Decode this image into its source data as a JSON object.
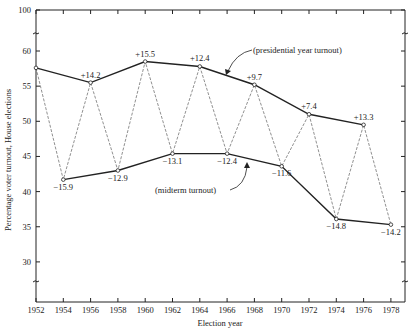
{
  "chart_data": {
    "type": "line",
    "title": "",
    "xlabel": "Election year",
    "ylabel": "Percentage voter turnout, House elections",
    "ylim": [
      25,
      100
    ],
    "y_axis_break": true,
    "y_ticks": [
      100,
      60,
      55,
      50,
      45,
      40,
      35,
      30
    ],
    "x_ticks": [
      "1952",
      "1954",
      "1956",
      "1958",
      "1960",
      "1962",
      "1964",
      "1966",
      "1968",
      "1970",
      "1972",
      "1974",
      "1976",
      "1978"
    ],
    "grid": false,
    "legend": "none",
    "series": [
      {
        "name": "presidential year turnout",
        "style": "solid",
        "x": [
          1952,
          1956,
          1960,
          1964,
          1968,
          1972,
          1976
        ],
        "values": [
          57.6,
          55.5,
          58.5,
          57.8,
          55.2,
          51.0,
          49.5
        ],
        "labels": [
          "",
          "+14.2",
          "+15.5",
          "+12.4",
          "+9.7",
          "+7.4",
          "+13.3"
        ]
      },
      {
        "name": "midterm turnout",
        "style": "solid",
        "x": [
          1954,
          1958,
          1962,
          1966,
          1970,
          1974,
          1978
        ],
        "values": [
          41.7,
          43.0,
          45.4,
          45.4,
          43.6,
          36.1,
          35.3
        ],
        "labels": [
          "-15.9",
          "-12.9",
          "-13.1",
          "-12.4",
          "-11.6",
          "-14.8",
          "-14.2"
        ]
      },
      {
        "name": "zigzag connecting consecutive elections",
        "style": "dashed",
        "x": [
          1952,
          1954,
          1956,
          1958,
          1960,
          1962,
          1964,
          1966,
          1968,
          1970,
          1972,
          1974,
          1976,
          1978
        ],
        "values": [
          57.6,
          41.7,
          55.5,
          43.0,
          58.5,
          45.4,
          57.8,
          45.4,
          55.2,
          43.6,
          51.0,
          36.1,
          49.5,
          35.3
        ]
      }
    ],
    "annotations": [
      {
        "text": "(presidential year turnout)",
        "points_to": "presidential line near 1966-1968"
      },
      {
        "text": "(midterm turnout)",
        "points_to": "midterm line near 1967"
      }
    ]
  }
}
